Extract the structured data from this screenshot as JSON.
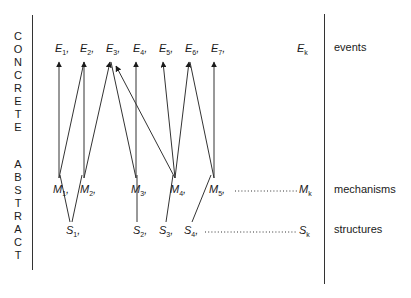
{
  "left_axis": {
    "concrete_letters": [
      "C",
      "O",
      "N",
      "C",
      "R",
      "E",
      "T",
      "E"
    ],
    "abstract_letters": [
      "A",
      "B",
      "S",
      "T",
      "R",
      "A",
      "C",
      "T"
    ]
  },
  "right_labels": {
    "events": "events",
    "mechanisms": "mechanisms",
    "structures": "structures"
  },
  "events": [
    {
      "base": "E",
      "sub": "1",
      "sep": ","
    },
    {
      "base": "E",
      "sub": "2",
      "sep": ","
    },
    {
      "base": "E",
      "sub": "3",
      "sep": ","
    },
    {
      "base": "E",
      "sub": "4",
      "sep": ","
    },
    {
      "base": "E",
      "sub": "5",
      "sep": ","
    },
    {
      "base": "E",
      "sub": "6",
      "sep": ","
    },
    {
      "base": "E",
      "sub": "7",
      "sep": ","
    },
    {
      "base": "E",
      "sub": "k",
      "sep": ""
    }
  ],
  "mechanisms": [
    {
      "base": "M",
      "sub": "1",
      "sep": ","
    },
    {
      "base": "M",
      "sub": "2",
      "sep": ","
    },
    {
      "base": "M",
      "sub": "3",
      "sep": ","
    },
    {
      "base": "M",
      "sub": "4",
      "sep": ","
    },
    {
      "base": "M",
      "sub": "5",
      "sep": ","
    },
    {
      "base": "M",
      "sub": "k",
      "sep": ""
    }
  ],
  "structures": [
    {
      "base": "S",
      "sub": "1",
      "sep": ","
    },
    {
      "base": "S",
      "sub": "2",
      "sep": ","
    },
    {
      "base": "S",
      "sub": "3",
      "sep": ","
    },
    {
      "base": "S",
      "sub": "4",
      "sep": ","
    },
    {
      "base": "S",
      "sub": "k",
      "sep": ""
    }
  ],
  "connections": {
    "mechanism_to_event": [
      [
        "M1",
        "E1"
      ],
      [
        "M1",
        "E2"
      ],
      [
        "M2",
        "E2"
      ],
      [
        "M2",
        "E3"
      ],
      [
        "M3",
        "E3"
      ],
      [
        "M3",
        "E4"
      ],
      [
        "M4",
        "E3"
      ],
      [
        "M4",
        "E5"
      ],
      [
        "M4",
        "E6"
      ],
      [
        "M5",
        "E6"
      ],
      [
        "M5",
        "E7"
      ]
    ],
    "structure_to_mechanism": [
      [
        "S1",
        "M1"
      ],
      [
        "S1",
        "M2"
      ],
      [
        "S2",
        "M3"
      ],
      [
        "S3",
        "M4"
      ],
      [
        "S4",
        "M5"
      ]
    ]
  }
}
